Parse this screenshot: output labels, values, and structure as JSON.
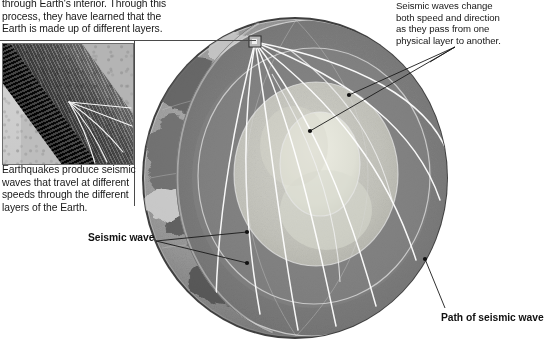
{
  "figure": {
    "background_color": "#ffffff",
    "text_color": "#171717"
  },
  "top_paragraph": {
    "lines": [
      "through Earth's interior. Through this",
      "process, they have learned that the",
      "Earth is made up of different layers."
    ]
  },
  "inset": {
    "alt": "close-up photograph of Earth's crust with seismic wave rays",
    "caption_lines": [
      "Earthquakes produce seismic",
      "waves that travel at different",
      "speeds through the different",
      "layers of the Earth."
    ]
  },
  "callouts": [
    {
      "name": "seismic-waves-change-callout",
      "lines": [
        "Seismic waves change",
        "both speed and direction",
        "as they pass from one",
        "physical layer to another."
      ]
    }
  ],
  "labels": [
    {
      "name": "seismic-wave-label",
      "text": "Seismic wave"
    },
    {
      "name": "path-of-seismic-wave-label",
      "text": "Path of seismic wave"
    }
  ],
  "earth": {
    "layers": [
      {
        "name": "crust",
        "color": "#8e8e8e"
      },
      {
        "name": "mantle",
        "color": "#7d7d7d"
      },
      {
        "name": "outer-core",
        "color": "#c6c6c0"
      },
      {
        "name": "inner-core",
        "color": "#dcdcd2"
      }
    ],
    "epicenter": {
      "name": "earthquake-epicenter-marker",
      "x": 255,
      "y": 42
    },
    "ray_color": "#ffffff",
    "leader_color": "#1a1a1a"
  }
}
